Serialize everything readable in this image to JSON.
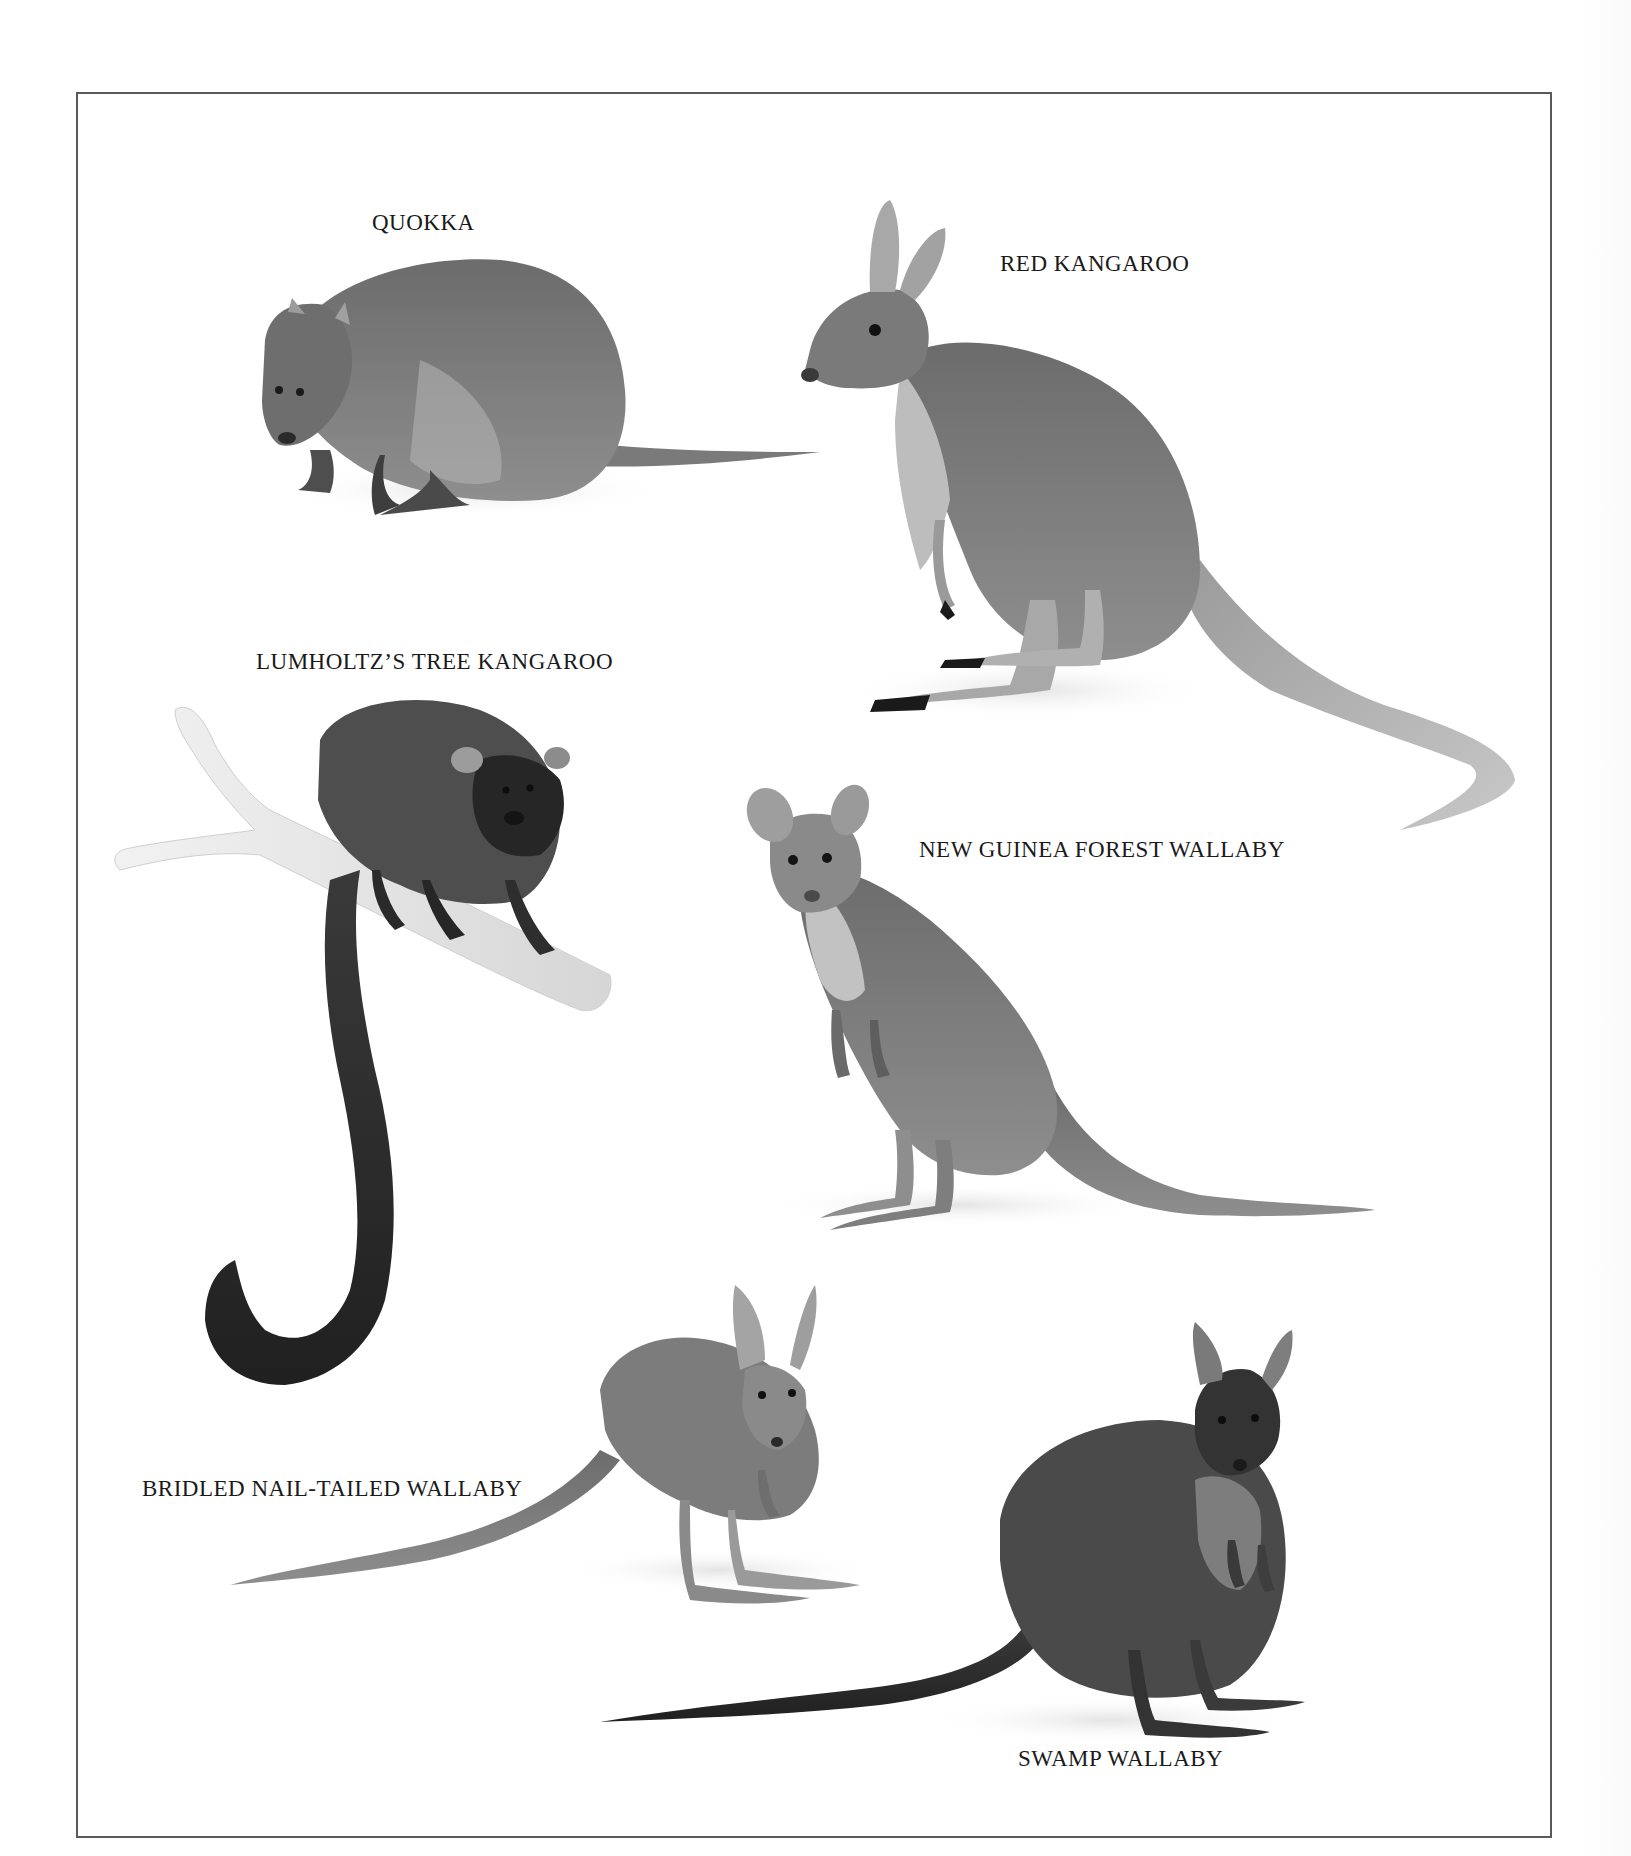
{
  "plate": {
    "frame_color": "#5a5a5a",
    "background": "#ffffff"
  },
  "animals": [
    {
      "id": "quokka",
      "label": "QUOKKA"
    },
    {
      "id": "red-kangaroo",
      "label": "RED KANGAROO"
    },
    {
      "id": "lumholtz-tree-kangaroo",
      "label": "LUMHOLTZ’S TREE KANGAROO"
    },
    {
      "id": "new-guinea-forest-wallaby",
      "label": "NEW GUINEA FOREST WALLABY"
    },
    {
      "id": "bridled-nail-tailed-wallaby",
      "label": "BRIDLED NAIL-TAILED WALLABY"
    },
    {
      "id": "swamp-wallaby",
      "label": "SWAMP WALLABY"
    }
  ]
}
